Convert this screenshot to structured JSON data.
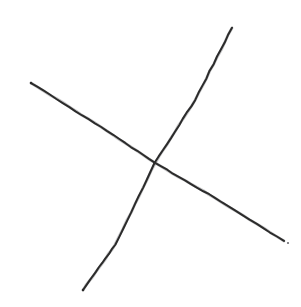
{
  "canvas": {
    "width": 301,
    "height": 307,
    "background_color": "#ffffff",
    "medium": "pen-on-paper",
    "title": "Two crossing hand-drawn straight strokes forming an X"
  },
  "palette": {
    "ink": "#2b2b2b",
    "ink_light": "#44444a",
    "paper": "#ffffff",
    "speck": "#6d6d73"
  },
  "chart_data": {
    "type": "line",
    "xlabel": "",
    "ylabel": "",
    "xlim": [
      0,
      301
    ],
    "ylim": [
      0,
      307
    ],
    "grid": false,
    "legend": "none",
    "axes_visible": false,
    "tick_labels": [],
    "annotations": [],
    "intersection": {
      "x": 155,
      "y": 163
    },
    "series": [
      {
        "name": "descending-stroke",
        "label": "upper-left to lower-right stroke",
        "color": "#2b2b2b",
        "stroke_width": 2.0,
        "start": {
          "x": 31,
          "y": 83
        },
        "end": {
          "x": 284,
          "y": 241
        },
        "x": [
          31,
          95,
          155,
          215,
          284
        ],
        "y": [
          83,
          123,
          163,
          198,
          241
        ]
      },
      {
        "name": "ascending-stroke",
        "label": "lower-left to upper-right stroke",
        "color": "#2b2b2b",
        "stroke_width": 2.0,
        "start": {
          "x": 83,
          "y": 290
        },
        "end": {
          "x": 232,
          "y": 28
        },
        "x": [
          83,
          115,
          155,
          195,
          232
        ],
        "y": [
          290,
          245,
          163,
          100,
          28
        ]
      }
    ],
    "marks": [
      {
        "name": "ink-speck",
        "x": 288,
        "y": 243,
        "radius": 1.1,
        "color": "#6d6d73"
      }
    ]
  }
}
